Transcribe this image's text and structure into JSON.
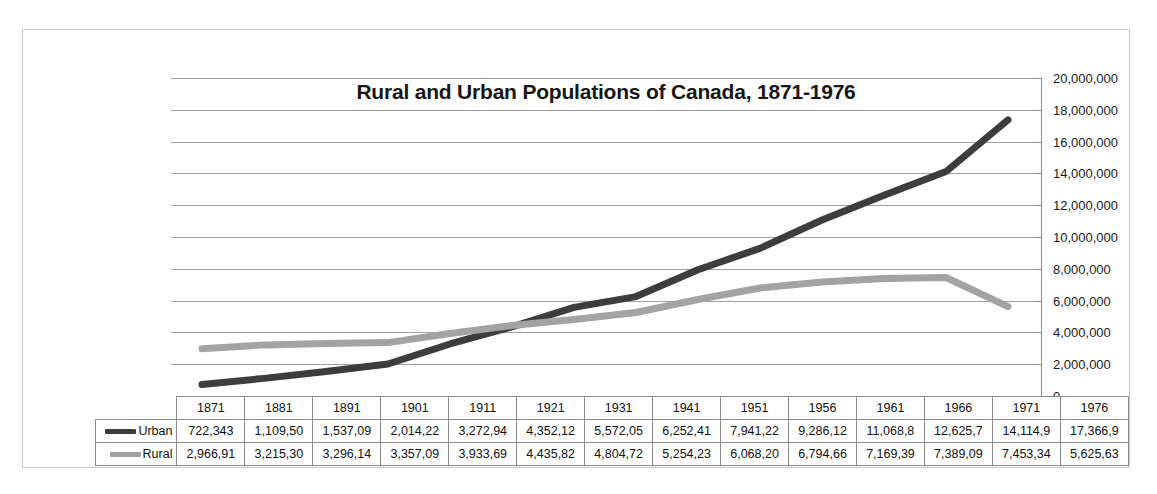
{
  "chart_data": {
    "type": "line",
    "title": "Rural and Urban Populations of Canada, 1871-1976",
    "xlabel": "",
    "ylabel": "",
    "ylim": [
      0,
      20000000
    ],
    "ytick_labels": [
      "20,000,000",
      "18,000,000",
      "16,000,000",
      "14,000,000",
      "12,000,000",
      "10,000,000",
      "8,000,000",
      "6,000,000",
      "4,000,000",
      "2,000,000",
      "0"
    ],
    "ytick_values": [
      20000000,
      18000000,
      16000000,
      14000000,
      12000000,
      10000000,
      8000000,
      6000000,
      4000000,
      2000000,
      0
    ],
    "grid": true,
    "legend_position": "data-table-left",
    "categories": [
      "1871",
      "1881",
      "1891",
      "1901",
      "1911",
      "1921",
      "1931",
      "1941",
      "1951",
      "1956",
      "1961",
      "1966",
      "1971",
      "1976"
    ],
    "series": [
      {
        "name": "Urban",
        "color": "#3d3d3d",
        "values": [
          722343,
          1109500,
          1537090,
          2014220,
          3272940,
          4352120,
          5572050,
          6252410,
          7941220,
          9286120,
          11068800,
          12625700,
          14114900,
          17366900
        ],
        "labels": [
          "722,343",
          "1,109,50",
          "1,537,09",
          "2,014,22",
          "3,272,94",
          "4,352,12",
          "5,572,05",
          "6,252,41",
          "7,941,22",
          "9,286,12",
          "11,068,8",
          "12,625,7",
          "14,114,9",
          "17,366,9"
        ]
      },
      {
        "name": "Rural",
        "color": "#a3a3a3",
        "values": [
          2966910,
          3215300,
          3296140,
          3357090,
          3933690,
          4435820,
          4804720,
          5254230,
          6068200,
          6794660,
          7169390,
          7389090,
          7453340,
          5625630
        ],
        "labels": [
          "2,966,91",
          "3,215,30",
          "3,296,14",
          "3,357,09",
          "3,933,69",
          "4,435,82",
          "4,804,72",
          "5,254,23",
          "6,068,20",
          "6,794,66",
          "7,169,39",
          "7,389,09",
          "7,453,34",
          "5,625,63"
        ]
      }
    ]
  },
  "legend": {
    "urban_label": "Urban",
    "rural_label": "Rural"
  }
}
